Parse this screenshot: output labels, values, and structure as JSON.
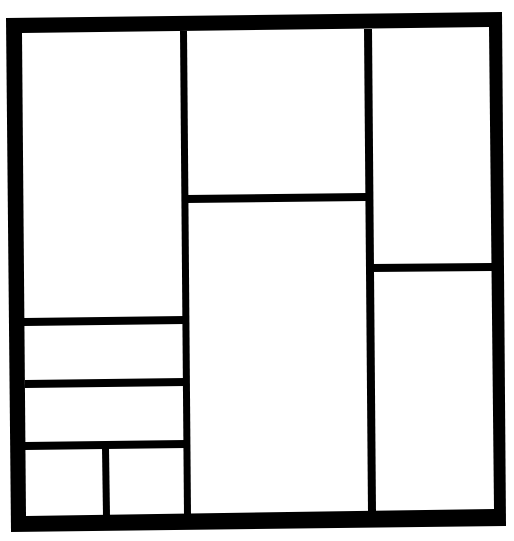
{
  "diagram": {
    "type": "comic-panel-layout",
    "title": "",
    "colors": {
      "background": "#ffffff",
      "border": "#000000",
      "panel_fill": "#ffffff"
    },
    "columns": 3,
    "panel_count": 10,
    "panels": [
      {
        "id": "panel-1",
        "column": "left",
        "row": 1
      },
      {
        "id": "panel-2",
        "column": "left",
        "row": 2
      },
      {
        "id": "panel-3",
        "column": "left",
        "row": 3
      },
      {
        "id": "panel-4",
        "column": "left",
        "row": 4,
        "sub": "left"
      },
      {
        "id": "panel-5",
        "column": "left",
        "row": 4,
        "sub": "right"
      },
      {
        "id": "panel-6",
        "column": "middle",
        "row": 1
      },
      {
        "id": "panel-7",
        "column": "middle",
        "row": 2
      },
      {
        "id": "panel-8",
        "column": "right",
        "row": 1
      },
      {
        "id": "panel-9",
        "column": "right",
        "row": 2
      }
    ]
  }
}
